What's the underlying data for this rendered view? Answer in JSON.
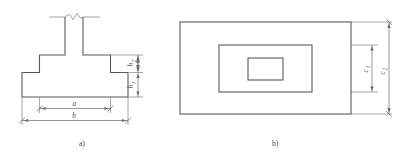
{
  "figure": {
    "panels": [
      {
        "id": "panel-a",
        "caption": "a)",
        "view": "section",
        "description": "Stepped spread footing cross-section with column break symbol",
        "dimensions": [
          {
            "name": "h2",
            "symbol": "h",
            "subscript": "2",
            "orientation": "vertical",
            "target": "upper-step-height"
          },
          {
            "name": "h1",
            "symbol": "h",
            "subscript": "1",
            "orientation": "vertical",
            "target": "base-slab-height"
          },
          {
            "name": "a",
            "symbol": "a",
            "subscript": "",
            "orientation": "horizontal",
            "target": "upper-step-width"
          },
          {
            "name": "b",
            "symbol": "b",
            "subscript": "",
            "orientation": "horizontal",
            "target": "base-slab-width"
          }
        ]
      },
      {
        "id": "panel-b",
        "caption": "b)",
        "view": "plan",
        "description": "Plan view of stepped footing: three nested rectangles",
        "dimensions": [
          {
            "name": "c1",
            "symbol": "c",
            "subscript": "1",
            "orientation": "vertical",
            "target": "middle-rectangle-height"
          },
          {
            "name": "c2",
            "symbol": "c",
            "subscript": "2",
            "orientation": "vertical",
            "target": "outer-rectangle-height"
          }
        ]
      }
    ],
    "colors": {
      "outline": "#595959",
      "dimension": "#6b6b6b",
      "label": "#4a4a4a",
      "background": "#ffffff"
    }
  }
}
